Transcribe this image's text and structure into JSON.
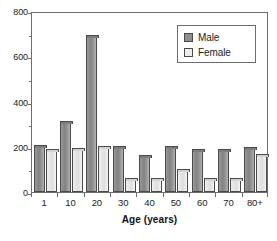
{
  "chart_data": {
    "type": "bar",
    "title": "",
    "xlabel": "Age (years)",
    "ylabel": "",
    "categories": [
      "1",
      "10",
      "20",
      "30",
      "40",
      "50",
      "60",
      "70",
      "80+"
    ],
    "series": [
      {
        "name": "Male",
        "color": "#8e8e8e",
        "values": [
          200,
          305,
          685,
          195,
          155,
          195,
          180,
          182,
          190
        ]
      },
      {
        "name": "Female",
        "color": "#ececec",
        "values": [
          180,
          185,
          195,
          52,
          52,
          95,
          52,
          52,
          160
        ]
      }
    ],
    "ylim": [
      0,
      800
    ],
    "yticks": [
      0,
      200,
      400,
      600,
      800
    ],
    "ytick_labels": [
      "0",
      "200",
      "400",
      "600",
      "800"
    ],
    "yminor_ticks": [
      100,
      300,
      500,
      700
    ],
    "grid": false,
    "legend_position": "top-right",
    "legend_entries": [
      "Male",
      "Female"
    ]
  },
  "axis": {
    "x_title": "Age (years)"
  },
  "legend": {
    "items": [
      {
        "label": "Male"
      },
      {
        "label": "Female"
      }
    ]
  }
}
